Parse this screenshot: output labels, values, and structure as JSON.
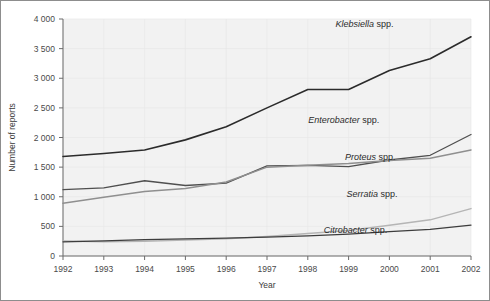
{
  "chart_data": {
    "type": "line",
    "title": "",
    "xlabel": "Year",
    "ylabel": "Number of reports",
    "categories": [
      1992,
      1993,
      1994,
      1995,
      1996,
      1997,
      1998,
      1999,
      2000,
      2001,
      2002
    ],
    "x": [
      1992,
      1993,
      1994,
      1995,
      1996,
      1997,
      1998,
      1999,
      2000,
      2001,
      2002
    ],
    "xlim": [
      1992,
      2002
    ],
    "ylim": [
      0,
      4000
    ],
    "y_ticks": [
      0,
      500,
      1000,
      1500,
      2000,
      2500,
      3000,
      3500,
      4000
    ],
    "y_tick_labels": [
      "0",
      "500",
      "1 000",
      "1 500",
      "2 000",
      "2 500",
      "3 000",
      "3 500",
      "4 000"
    ],
    "x_tick_labels": [
      "1992",
      "1993",
      "1994",
      "1995",
      "1996",
      "1997",
      "1998",
      "1999",
      "2000",
      "2001",
      "2002"
    ],
    "grid": true,
    "legend_position": "inline-right",
    "series": [
      {
        "name": "Klebsiella spp.",
        "genus": "Klebsiella",
        "suffix": " spp.",
        "color": "#2b2b2b",
        "width": 1.6,
        "values": [
          1680,
          1730,
          1790,
          1960,
          2180,
          2500,
          2810,
          2810,
          3130,
          3330,
          3700
        ]
      },
      {
        "name": "Enterobacter spp.",
        "genus": "Enterobacter",
        "suffix": " spp.",
        "color": "#4f4f4f",
        "width": 1.3,
        "values": [
          1120,
          1150,
          1270,
          1190,
          1230,
          1520,
          1530,
          1510,
          1620,
          1700,
          2050
        ]
      },
      {
        "name": "Proteus spp.",
        "genus": "Proteus",
        "suffix": " spp.",
        "color": "#8f8f8f",
        "width": 1.5,
        "values": [
          890,
          990,
          1090,
          1140,
          1250,
          1500,
          1530,
          1560,
          1610,
          1650,
          1790
        ]
      },
      {
        "name": "Serratia spp.",
        "genus": "Serratia",
        "suffix": " spp.",
        "color": "#b5b5b5",
        "width": 1.5,
        "values": [
          255,
          240,
          250,
          270,
          290,
          330,
          380,
          430,
          520,
          610,
          800
        ]
      },
      {
        "name": "Citrobacter spp.",
        "genus": "Citrobacter",
        "suffix": " spp.",
        "color": "#3d3d3d",
        "width": 1.3,
        "values": [
          240,
          255,
          275,
          290,
          300,
          320,
          340,
          370,
          410,
          450,
          520
        ]
      }
    ],
    "series_label_positions": [
      {
        "name": "Klebsiella spp.",
        "x": 2000.1,
        "y": 3870
      },
      {
        "name": "Enterobacter spp.",
        "x": 1999.75,
        "y": 2250
      },
      {
        "name": "Proteus spp.",
        "x": 2000.15,
        "y": 1620
      },
      {
        "name": "Serratia spp.",
        "x": 2000.2,
        "y": 1000
      },
      {
        "name": "Citrobacter spp.",
        "x": 1999.95,
        "y": 380
      }
    ]
  }
}
